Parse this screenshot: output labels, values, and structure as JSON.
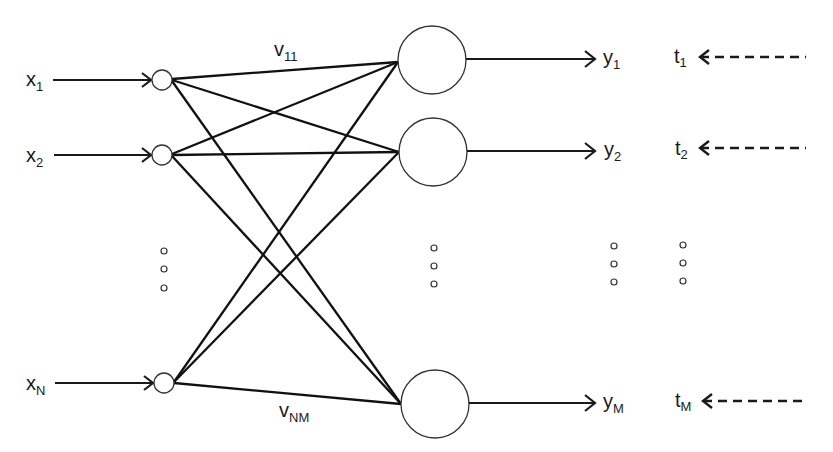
{
  "diagram": {
    "type": "single-layer neural network",
    "inputs": [
      {
        "label": "x",
        "sub": "1",
        "y": 80
      },
      {
        "label": "x",
        "sub": "2",
        "y": 155
      },
      {
        "label": "x",
        "sub": "N",
        "y": 383
      }
    ],
    "outputs": [
      {
        "label": "y",
        "sub": "1",
        "target": "t",
        "target_sub": "1",
        "y": 60
      },
      {
        "label": "y",
        "sub": "2",
        "target": "t",
        "target_sub": "2",
        "y": 152
      },
      {
        "label": "y",
        "sub": "M",
        "target": "t",
        "target_sub": "M",
        "y": 404
      }
    ],
    "weights": [
      {
        "label": "v",
        "sub": "11"
      },
      {
        "label": "v",
        "sub": "NM"
      }
    ],
    "ellipsis": "..."
  }
}
